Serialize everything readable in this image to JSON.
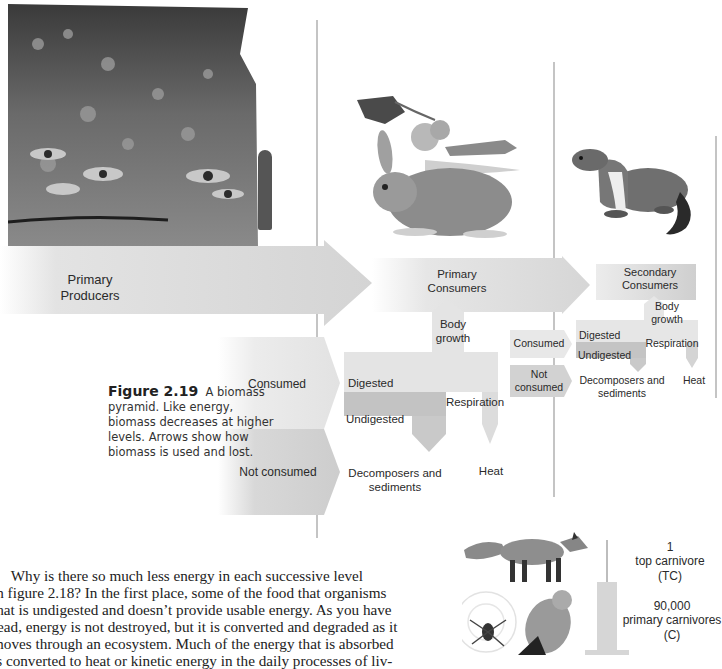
{
  "figure": {
    "number": "Figure 2.19",
    "caption": "A biomass pyramid. Like energy, biomass decreases at higher levels. Arrows show how biomass is used and lost."
  },
  "levels": {
    "primary_producers": {
      "label_line1": "Primary",
      "label_line2": "Producers",
      "image": "flower-meadow-photo"
    },
    "primary_consumers": {
      "label_line1": "Primary",
      "label_line2": "Consumers",
      "image": "rabbit-butterfly-grasshopper-illustration"
    },
    "secondary_consumers": {
      "label_line1": "Secondary",
      "label_line2": "Consumers",
      "image": "weasel-illustration"
    }
  },
  "flows_level1": {
    "consumed": "Consumed",
    "not_consumed": "Not consumed"
  },
  "flows_level2": {
    "digested": "Digested",
    "undigested": "Undigested",
    "body_growth_1": "Body",
    "body_growth_2": "growth",
    "respiration": "Respiration",
    "heat": "Heat",
    "decomposers_1": "Decomposers and",
    "decomposers_2": "sediments"
  },
  "flows_level3": {
    "consumed": "Consumed",
    "not_consumed_1": "Not",
    "not_consumed_2": "consumed",
    "digested": "Digested",
    "undigested": "Undigested",
    "body_growth_1": "Body",
    "body_growth_2": "growth",
    "respiration": "Respiration",
    "heat": "Heat",
    "decomposers_1": "Decomposers and",
    "decomposers_2": "sediments"
  },
  "next_figure": {
    "top": {
      "count": "1",
      "label": "top carnivore",
      "abbr": "(TC)",
      "image": "fox-illustration"
    },
    "second": {
      "count": "90,000",
      "label": "primary carnivores",
      "abbr": "(C)",
      "image": "spider-and-kestrel-illustration"
    }
  },
  "body_text": {
    "lines": [
      "     Why is there so much less energy in each successive level",
      "in figure 2.18? In the first place, some of the food that organisms",
      "that is undigested and doesn’t provide usable energy. As you have",
      "read, energy is not destroyed, but it is converted and degraded as it",
      "moves through an ecosystem. Much of the energy that is absorbed",
      "is converted to heat or kinetic energy in the daily processes of liv-"
    ]
  }
}
